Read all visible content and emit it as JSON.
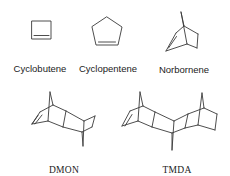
{
  "figure": {
    "molecules": [
      {
        "id": "cyclobutene",
        "label": "Cyclobutene"
      },
      {
        "id": "cyclopentene",
        "label": "Cyclopentene"
      },
      {
        "id": "norbornene",
        "label": "Norbornene"
      },
      {
        "id": "dmon",
        "label": "DMON"
      },
      {
        "id": "tmda",
        "label": "TMDA"
      }
    ]
  }
}
